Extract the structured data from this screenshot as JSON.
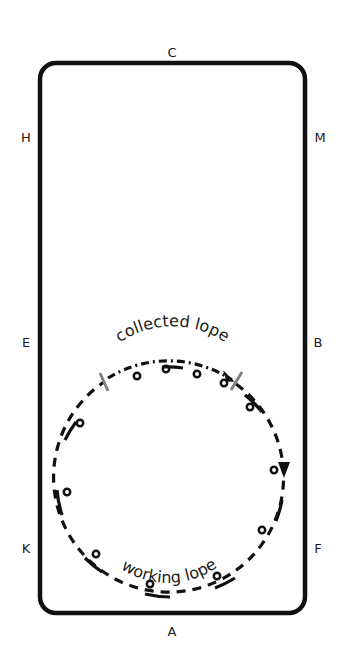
{
  "diagram": {
    "type": "dressage-arena-exercise",
    "arena": {
      "shape": "rounded-rectangle",
      "border_color": "#111111",
      "letters": {
        "top": "C",
        "bottom": "A",
        "left": [
          "H",
          "E",
          "K"
        ],
        "right": [
          "M",
          "B",
          "F"
        ]
      }
    },
    "path": {
      "shape": "circle",
      "direction": "clockwise",
      "segments": [
        {
          "name": "collected",
          "label": "collected lope",
          "style": "dash-dot"
        },
        {
          "name": "working",
          "label": "working lope",
          "style": "dashed"
        }
      ],
      "transition_marker_color": "#808080",
      "stride_markers": 12
    }
  },
  "labels": {
    "C": "C",
    "A": "A",
    "H": "H",
    "E": "E",
    "K": "K",
    "M": "M",
    "B": "B",
    "F": "F",
    "collected": "collected lope",
    "working": "working lope"
  }
}
